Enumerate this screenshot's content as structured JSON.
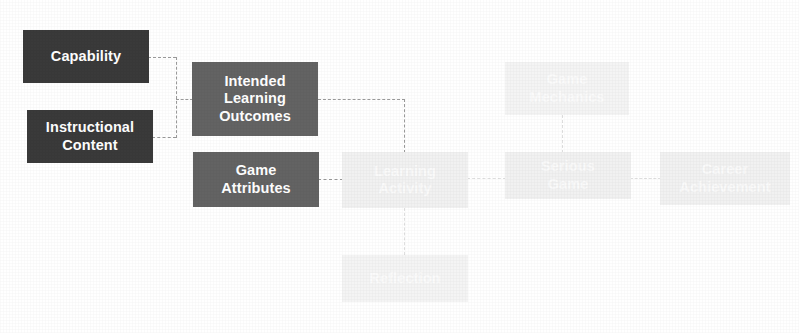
{
  "diagram": {
    "palette": {
      "dark_box": "#3a3a3a",
      "mid_box": "#636363",
      "faint_box": "#f1f1f1",
      "connector": "#9a9a9a",
      "faint_connector": "#dedede",
      "background": "#ffffff",
      "box_text": "#ffffff"
    },
    "nodes": [
      {
        "id": "capability",
        "label": "Capability",
        "tone": "dark"
      },
      {
        "id": "instructional",
        "label": "Instructional\nContent",
        "tone": "dark"
      },
      {
        "id": "ilo",
        "label": "Intended\nLearning\nOutcomes",
        "tone": "mid"
      },
      {
        "id": "game-attributes",
        "label": "Game\nAttributes",
        "tone": "mid"
      },
      {
        "id": "learning-activity",
        "label": "Learning\nActivity",
        "tone": "faint"
      },
      {
        "id": "reflection",
        "label": "Reflection",
        "tone": "faint"
      },
      {
        "id": "game-mechanics",
        "label": "Game\nMechanics",
        "tone": "faint"
      },
      {
        "id": "serious-game",
        "label": "Serious\nGame",
        "tone": "faint"
      },
      {
        "id": "career-achievement",
        "label": "Career\nAchievement",
        "tone": "faint"
      }
    ],
    "edges": [
      {
        "from": "capability",
        "to": "ilo",
        "style": "dashed"
      },
      {
        "from": "instructional",
        "to": "ilo",
        "style": "dashed"
      },
      {
        "from": "ilo",
        "to": "learning-activity",
        "style": "dashed"
      },
      {
        "from": "game-attributes",
        "to": "learning-activity",
        "style": "dashed"
      },
      {
        "from": "learning-activity",
        "to": "reflection",
        "style": "dashed"
      },
      {
        "from": "learning-activity",
        "to": "serious-game",
        "style": "dashed"
      },
      {
        "from": "game-mechanics",
        "to": "serious-game",
        "style": "dashed"
      },
      {
        "from": "serious-game",
        "to": "career-achievement",
        "style": "dashed"
      }
    ]
  }
}
